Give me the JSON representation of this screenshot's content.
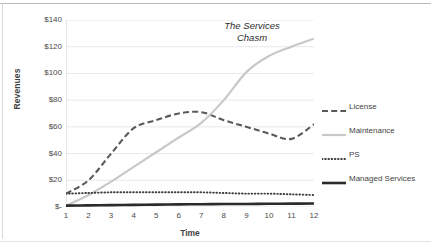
{
  "chart_data": {
    "type": "line",
    "title": "",
    "xlabel": "Time",
    "ylabel": "Revenues",
    "annotation": "The Services Chasm",
    "annotation_line1": "The Services",
    "annotation_line2": "Chasm",
    "x": [
      1,
      2,
      3,
      4,
      5,
      6,
      7,
      8,
      9,
      10,
      11,
      12
    ],
    "categories": [
      "1",
      "2",
      "3",
      "4",
      "5",
      "6",
      "7",
      "8",
      "9",
      "10",
      "11",
      "12"
    ],
    "ylim": [
      0,
      140
    ],
    "ytick_values": [
      0,
      20,
      40,
      60,
      80,
      100,
      120,
      140
    ],
    "ytick_labels": [
      "$-",
      "$20",
      "$40",
      "$60",
      "$80",
      "$100",
      "$120",
      "$140"
    ],
    "grid": true,
    "grid_axis": "y",
    "legend_position": "right",
    "series": [
      {
        "name": "License",
        "style": "dashed",
        "color": "#59595b",
        "values": [
          10,
          20,
          40,
          59,
          65,
          70,
          71,
          65,
          60,
          55,
          51,
          62
        ]
      },
      {
        "name": "Maintenance",
        "style": "solid-light",
        "color": "#c8c8c8",
        "values": [
          1,
          9,
          19,
          30,
          41,
          52,
          63,
          80,
          101,
          113,
          120,
          126
        ]
      },
      {
        "name": "PS",
        "style": "dotted",
        "color": "#3d3d3d",
        "values": [
          10,
          10.5,
          11,
          11,
          11,
          11,
          11,
          10.5,
          10,
          10,
          9.5,
          9
        ]
      },
      {
        "name": "Managed Services",
        "style": "solid-thick",
        "color": "#2b2b2b",
        "values": [
          1,
          1.2,
          1.4,
          1.6,
          1.8,
          2,
          2.1,
          2.2,
          2.3,
          2.4,
          2.5,
          2.6
        ]
      }
    ]
  },
  "legend": {
    "items": [
      {
        "label": "License",
        "style": "dashed",
        "color": "#59595b"
      },
      {
        "label": "Maintenance",
        "style": "solid-light",
        "color": "#c8c8c8"
      },
      {
        "label": "PS",
        "style": "dotted",
        "color": "#3d3d3d"
      },
      {
        "label": "Managed Services",
        "style": "solid-thick",
        "color": "#2b2b2b"
      }
    ]
  },
  "colors": {
    "background": "#ffffff",
    "gridline": "#e8e8e8",
    "axis": "#d0d0d0",
    "text": "#3f3f3f"
  }
}
